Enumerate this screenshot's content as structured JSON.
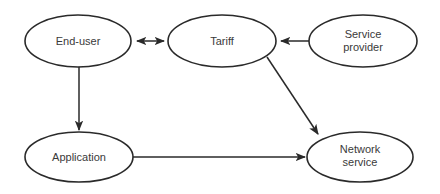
{
  "diagram": {
    "type": "flow",
    "nodes": [
      {
        "id": "end_user",
        "label": "End-user",
        "lines": [
          "End-user"
        ]
      },
      {
        "id": "tariff",
        "label": "Tariff",
        "lines": [
          "Tariff"
        ]
      },
      {
        "id": "service_provider",
        "label": "Service provider",
        "lines": [
          "Service",
          "provider"
        ]
      },
      {
        "id": "application",
        "label": "Application",
        "lines": [
          "Application"
        ]
      },
      {
        "id": "network_service",
        "label": "Network service",
        "lines": [
          "Network",
          "service"
        ]
      }
    ],
    "edges": [
      {
        "from": "end_user",
        "to": "tariff",
        "bidirectional": true
      },
      {
        "from": "service_provider",
        "to": "tariff",
        "bidirectional": false
      },
      {
        "from": "end_user",
        "to": "application",
        "bidirectional": false
      },
      {
        "from": "tariff",
        "to": "network_service",
        "bidirectional": false
      },
      {
        "from": "application",
        "to": "network_service",
        "bidirectional": false
      }
    ]
  }
}
